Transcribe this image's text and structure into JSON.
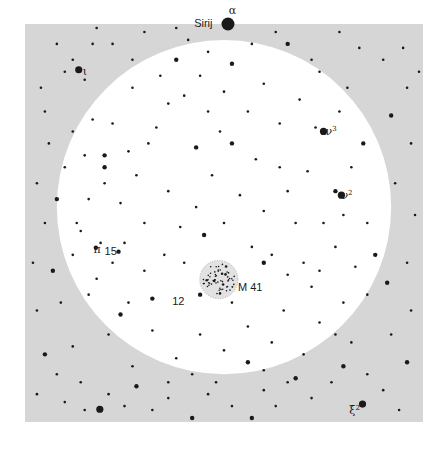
{
  "chart_data": {
    "type": "scatter",
    "title": "",
    "field": {
      "background_color": "#d6d6d6",
      "field_of_view_color": "#ffffff",
      "star_color": "#1a1a1a",
      "cluster_halo_color": "#e2e2e2"
    },
    "field_of_view": {
      "center": [
        0.5,
        0.46
      ],
      "radius": 0.42
    },
    "labels": [
      {
        "id": "alpha",
        "text": "α",
        "sup": "",
        "style": "greek",
        "at": [
          0.512,
          -0.035
        ]
      },
      {
        "id": "sirius",
        "text": "Sirij",
        "sup": "",
        "style": "latin",
        "at": [
          0.425,
          -0.003
        ]
      },
      {
        "id": "iota",
        "text": "ι",
        "sup": "",
        "style": "greek",
        "at": [
          0.145,
          0.117
        ]
      },
      {
        "id": "nu3",
        "text": "ν",
        "sup": "3",
        "style": "greek",
        "at": [
          0.755,
          0.27
        ]
      },
      {
        "id": "nu2",
        "text": "ν",
        "sup": "2",
        "style": "greek",
        "at": [
          0.795,
          0.43
        ]
      },
      {
        "id": "pi",
        "text": "π",
        "sup": "",
        "style": "greek",
        "at": [
          0.172,
          0.565
        ]
      },
      {
        "id": "15",
        "text": "15",
        "sup": "",
        "style": "latin",
        "at": [
          0.2,
          0.57
        ]
      },
      {
        "id": "m41",
        "text": "M 41",
        "sup": "",
        "style": "latin",
        "at": [
          0.535,
          0.66
        ]
      },
      {
        "id": "12",
        "text": "12",
        "sup": "",
        "style": "latin",
        "at": [
          0.37,
          0.695
        ]
      },
      {
        "id": "xi2",
        "text": "ξ",
        "sup": "2",
        "style": "greek",
        "at": [
          0.815,
          0.97
        ]
      }
    ],
    "cluster": {
      "name": "M 41",
      "center": [
        0.487,
        0.642
      ],
      "radius": 0.048,
      "members": 60
    },
    "bright_stars": [
      {
        "name": "Sirius",
        "at": [
          0.51,
          0.0
        ],
        "mag": 5
      },
      {
        "name": "iota",
        "at": [
          0.135,
          0.115
        ],
        "mag": 3
      },
      {
        "name": "nu3",
        "at": [
          0.75,
          0.27
        ],
        "mag": 3
      },
      {
        "name": "nu2",
        "at": [
          0.795,
          0.43
        ],
        "mag": 3
      },
      {
        "name": "pi",
        "at": [
          0.178,
          0.562
        ],
        "mag": 2
      },
      {
        "name": "15",
        "at": [
          0.235,
          0.572
        ],
        "mag": 2
      },
      {
        "name": "12",
        "at": [
          0.44,
          0.68
        ],
        "mag": 2
      },
      {
        "name": "xi2",
        "at": [
          0.848,
          0.955
        ],
        "mag": 3
      },
      {
        "name": "bottom-left-bright",
        "at": [
          0.188,
          0.968
        ],
        "mag": 3
      }
    ],
    "stars": [
      [
        0.04,
        0.16,
        1
      ],
      [
        0.05,
        0.22,
        1
      ],
      [
        0.08,
        0.05,
        1
      ],
      [
        0.1,
        0.12,
        1
      ],
      [
        0.12,
        0.09,
        1
      ],
      [
        0.15,
        0.14,
        1
      ],
      [
        0.17,
        0.05,
        1
      ],
      [
        0.06,
        0.3,
        1
      ],
      [
        0.03,
        0.4,
        1
      ],
      [
        0.08,
        0.44,
        2
      ],
      [
        0.05,
        0.5,
        1
      ],
      [
        0.02,
        0.6,
        1
      ],
      [
        0.07,
        0.62,
        2
      ],
      [
        0.03,
        0.72,
        1
      ],
      [
        0.09,
        0.7,
        1
      ],
      [
        0.05,
        0.83,
        2
      ],
      [
        0.12,
        0.81,
        1
      ],
      [
        0.08,
        0.88,
        1
      ],
      [
        0.14,
        0.9,
        1
      ],
      [
        0.03,
        0.93,
        1
      ],
      [
        0.1,
        0.95,
        1
      ],
      [
        0.15,
        0.97,
        1
      ],
      [
        0.21,
        0.93,
        1
      ],
      [
        0.25,
        0.96,
        1
      ],
      [
        0.28,
        0.91,
        2
      ],
      [
        0.32,
        0.97,
        1
      ],
      [
        0.36,
        0.94,
        1
      ],
      [
        0.42,
        0.99,
        2
      ],
      [
        0.46,
        0.93,
        1
      ],
      [
        0.52,
        0.96,
        1
      ],
      [
        0.57,
        0.99,
        2
      ],
      [
        0.6,
        0.92,
        1
      ],
      [
        0.63,
        0.96,
        1
      ],
      [
        0.68,
        0.89,
        2
      ],
      [
        0.72,
        0.94,
        1
      ],
      [
        0.77,
        0.9,
        1
      ],
      [
        0.8,
        0.86,
        2
      ],
      [
        0.86,
        0.88,
        1
      ],
      [
        0.9,
        0.92,
        1
      ],
      [
        0.94,
        0.97,
        1
      ],
      [
        0.96,
        0.85,
        2
      ],
      [
        0.92,
        0.78,
        1
      ],
      [
        0.97,
        0.72,
        1
      ],
      [
        0.91,
        0.65,
        2
      ],
      [
        0.96,
        0.6,
        1
      ],
      [
        0.98,
        0.48,
        1
      ],
      [
        0.93,
        0.4,
        1
      ],
      [
        0.97,
        0.3,
        1
      ],
      [
        0.92,
        0.23,
        2
      ],
      [
        0.96,
        0.16,
        1
      ],
      [
        0.9,
        0.09,
        1
      ],
      [
        0.84,
        0.06,
        1
      ],
      [
        0.79,
        0.02,
        1
      ],
      [
        0.72,
        0.09,
        1
      ],
      [
        0.66,
        0.05,
        2
      ],
      [
        0.63,
        0.02,
        1
      ],
      [
        0.95,
        0.06,
        1
      ],
      [
        0.99,
        0.12,
        1
      ],
      [
        0.3,
        0.02,
        1
      ],
      [
        0.22,
        0.05,
        1
      ],
      [
        0.18,
        0.01,
        1
      ],
      [
        0.38,
        0.01,
        1
      ],
      [
        0.34,
        0.13,
        1
      ],
      [
        0.38,
        0.09,
        2
      ],
      [
        0.44,
        0.13,
        1
      ],
      [
        0.4,
        0.18,
        1
      ],
      [
        0.27,
        0.16,
        1
      ],
      [
        0.22,
        0.25,
        1
      ],
      [
        0.31,
        0.3,
        1
      ],
      [
        0.28,
        0.38,
        1
      ],
      [
        0.2,
        0.4,
        1
      ],
      [
        0.24,
        0.45,
        1
      ],
      [
        0.36,
        0.42,
        1
      ],
      [
        0.43,
        0.46,
        1
      ],
      [
        0.39,
        0.51,
        1
      ],
      [
        0.3,
        0.5,
        1
      ],
      [
        0.47,
        0.38,
        1
      ],
      [
        0.52,
        0.3,
        2
      ],
      [
        0.56,
        0.22,
        1
      ],
      [
        0.6,
        0.15,
        1
      ],
      [
        0.64,
        0.25,
        1
      ],
      [
        0.69,
        0.19,
        1
      ],
      [
        0.58,
        0.34,
        1
      ],
      [
        0.54,
        0.43,
        1
      ],
      [
        0.6,
        0.47,
        1
      ],
      [
        0.66,
        0.42,
        1
      ],
      [
        0.71,
        0.37,
        1
      ],
      [
        0.75,
        0.5,
        1
      ],
      [
        0.82,
        0.36,
        1
      ],
      [
        0.85,
        0.3,
        2
      ],
      [
        0.86,
        0.5,
        1
      ],
      [
        0.88,
        0.58,
        2
      ],
      [
        0.83,
        0.61,
        1
      ],
      [
        0.78,
        0.56,
        1
      ],
      [
        0.72,
        0.66,
        1
      ],
      [
        0.8,
        0.7,
        1
      ],
      [
        0.86,
        0.68,
        1
      ],
      [
        0.74,
        0.75,
        1
      ],
      [
        0.65,
        0.72,
        1
      ],
      [
        0.62,
        0.8,
        1
      ],
      [
        0.56,
        0.76,
        1
      ],
      [
        0.5,
        0.82,
        1
      ],
      [
        0.44,
        0.78,
        1
      ],
      [
        0.38,
        0.84,
        1
      ],
      [
        0.32,
        0.77,
        1
      ],
      [
        0.26,
        0.7,
        1
      ],
      [
        0.21,
        0.78,
        1
      ],
      [
        0.27,
        0.86,
        1
      ],
      [
        0.18,
        0.64,
        1
      ],
      [
        0.12,
        0.58,
        1
      ],
      [
        0.13,
        0.5,
        1
      ],
      [
        0.16,
        0.44,
        1
      ],
      [
        0.2,
        0.33,
        2
      ],
      [
        0.2,
        0.36,
        2
      ],
      [
        0.26,
        0.32,
        1
      ],
      [
        0.15,
        0.33,
        1
      ],
      [
        0.17,
        0.24,
        1
      ],
      [
        0.12,
        0.27,
        1
      ],
      [
        0.1,
        0.36,
        1
      ],
      [
        0.46,
        0.22,
        1
      ],
      [
        0.49,
        0.27,
        1
      ],
      [
        0.43,
        0.31,
        2
      ],
      [
        0.36,
        0.2,
        1
      ],
      [
        0.33,
        0.26,
        1
      ],
      [
        0.52,
        0.1,
        2
      ],
      [
        0.5,
        0.17,
        1
      ],
      [
        0.62,
        0.58,
        1
      ],
      [
        0.6,
        0.6,
        2
      ],
      [
        0.57,
        0.56,
        1
      ],
      [
        0.66,
        0.63,
        1
      ],
      [
        0.7,
        0.6,
        1
      ],
      [
        0.74,
        0.62,
        1
      ],
      [
        0.45,
        0.53,
        2
      ],
      [
        0.5,
        0.5,
        1
      ],
      [
        0.4,
        0.6,
        1
      ],
      [
        0.35,
        0.58,
        1
      ],
      [
        0.3,
        0.62,
        1
      ],
      [
        0.32,
        0.69,
        2
      ],
      [
        0.24,
        0.73,
        2
      ],
      [
        0.56,
        0.85,
        2
      ],
      [
        0.6,
        0.87,
        1
      ],
      [
        0.52,
        0.7,
        1
      ],
      [
        0.7,
        0.83,
        1
      ],
      [
        0.78,
        0.78,
        1
      ],
      [
        0.82,
        0.8,
        1
      ],
      [
        0.78,
        0.42,
        2
      ],
      [
        0.8,
        0.48,
        1
      ],
      [
        0.68,
        0.5,
        1
      ],
      [
        0.64,
        0.36,
        1
      ],
      [
        0.73,
        0.26,
        1
      ],
      [
        0.79,
        0.22,
        1
      ],
      [
        0.81,
        0.16,
        1
      ],
      [
        0.74,
        0.12,
        1
      ],
      [
        0.57,
        0.05,
        1
      ],
      [
        0.46,
        0.07,
        1
      ],
      [
        0.41,
        0.04,
        1
      ],
      [
        0.27,
        0.09,
        1
      ],
      [
        0.25,
        0.55,
        1
      ],
      [
        0.22,
        0.6,
        1
      ],
      [
        0.16,
        0.68,
        1
      ],
      [
        0.19,
        0.55,
        1
      ],
      [
        0.14,
        0.52,
        1
      ],
      [
        0.48,
        0.9,
        1
      ],
      [
        0.42,
        0.88,
        1
      ],
      [
        0.36,
        0.9,
        1
      ],
      [
        0.66,
        0.9,
        1
      ]
    ]
  },
  "map": {
    "region": "Canis Major",
    "object": "M 41"
  }
}
